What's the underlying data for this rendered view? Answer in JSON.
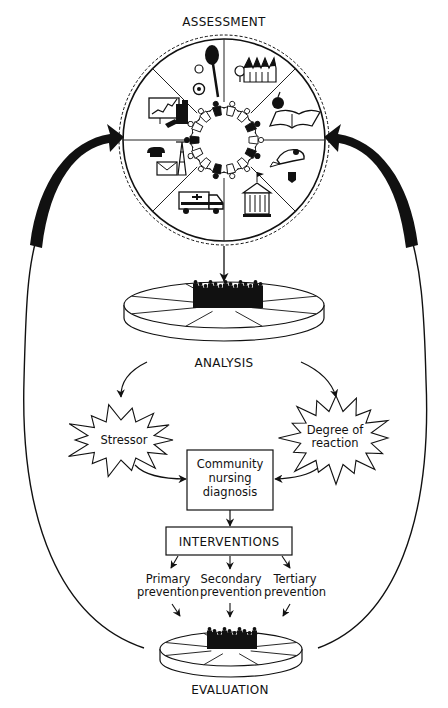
{
  "diagram": {
    "stages": {
      "assessment": "ASSESSMENT",
      "analysis": "ANALYSIS",
      "evaluation": "EVALUATION"
    },
    "assessment_wheel": {
      "segments": [
        {
          "name": "recreation",
          "icon": "recreation-icon"
        },
        {
          "name": "housing",
          "icon": "housing-icon"
        },
        {
          "name": "education",
          "icon": "education-icon"
        },
        {
          "name": "safety-transportation",
          "icon": "safety-icon"
        },
        {
          "name": "politics-government",
          "icon": "government-icon"
        },
        {
          "name": "health-social-services",
          "icon": "ambulance-icon"
        },
        {
          "name": "communication",
          "icon": "communication-icon"
        },
        {
          "name": "economics",
          "icon": "economics-icon"
        }
      ],
      "center": "community-core-people-icon"
    },
    "stressor": "Stressor",
    "degree_of_reaction": [
      "Degree of",
      "reaction"
    ],
    "diagnosis": [
      "Community",
      "nursing",
      "diagnosis"
    ],
    "interventions": "INTERVENTIONS",
    "prevention": [
      {
        "line1": "Primary",
        "line2": "prevention"
      },
      {
        "line1": "Secondary",
        "line2": "prevention"
      },
      {
        "line1": "Tertiary",
        "line2": "prevention"
      }
    ],
    "colors": {
      "ink": "#111111",
      "background": "#ffffff"
    }
  }
}
